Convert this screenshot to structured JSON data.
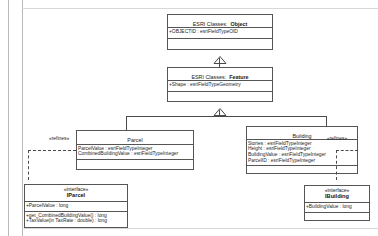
{
  "diagram": {
    "type": "uml-class-diagram",
    "background_color": "#ffffff",
    "border_color": "#555555",
    "line_color": "#4a4a4a"
  },
  "classes": {
    "object": {
      "stereotype_prefix": "ESRI Classes:",
      "name": "Object",
      "attributes": [
        "+OBJECTID : esriFieldTypeOID"
      ],
      "operations": []
    },
    "feature": {
      "stereotype_prefix": "ESRI Classes:",
      "name": "Feature",
      "attributes": [
        "+Shape : esriFieldTypeGeometry"
      ],
      "operations": []
    },
    "parcel": {
      "name": "Parcel",
      "attributes": [
        "ParcelValue : esriFieldTypeInteger",
        "CombinedBuildingValue : esriFieldTypeInteger"
      ],
      "operations": []
    },
    "building": {
      "name": "Building",
      "attributes": [
        "Stories : esriFieldTypeInteger",
        "Height : esriFieldTypeInteger",
        "BuildingValue : esriFieldTypeInteger",
        "ParcelID : esriFieldTypeInteger"
      ],
      "operations": []
    },
    "iparcel": {
      "stereotype": "«interface»",
      "name": "IParcel",
      "attributes": [
        "+ParcelValue : long"
      ],
      "operations": [
        "+get_CombinedBuildingValue() : long",
        "+TaxValue(in TaxRate : double) : long"
      ]
    },
    "ibuilding": {
      "stereotype": "«interface»",
      "name": "IBuilding",
      "attributes": [
        "+BuildingValue : long"
      ],
      "operations": []
    }
  },
  "edges": {
    "object_feature": {
      "kind": "generalization",
      "label": ""
    },
    "feature_parcel": {
      "kind": "generalization",
      "label": ""
    },
    "feature_building": {
      "kind": "generalization",
      "label": ""
    },
    "parcel_iparcel": {
      "kind": "realization",
      "label": "«refines»"
    },
    "building_ibuilding": {
      "kind": "realization",
      "label": "«refines»"
    }
  }
}
